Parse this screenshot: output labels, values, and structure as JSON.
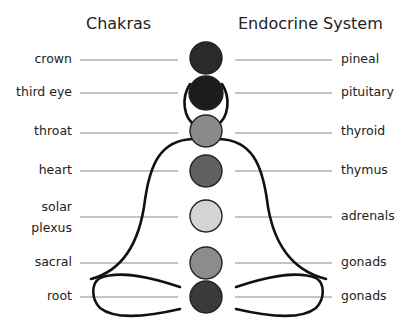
{
  "headings": {
    "chakras": "Chakras",
    "endocrine": "Endocrine System"
  },
  "rows": [
    {
      "chakra": "crown",
      "gland": "pineal",
      "color": "#2a2a2a"
    },
    {
      "chakra": "third eye",
      "gland": "pituitary",
      "color": "#1c1c1c"
    },
    {
      "chakra": "throat",
      "gland": "thyroid",
      "color": "#8a8a8a"
    },
    {
      "chakra": "heart",
      "gland": "thymus",
      "color": "#606060"
    },
    {
      "chakra": "solar plexus",
      "chakra_line1": "solar",
      "chakra_line2": "plexus",
      "gland": "adrenals",
      "color": "#d4d4d4"
    },
    {
      "chakra": "sacral",
      "gland": "gonads",
      "color": "#8c8c8c"
    },
    {
      "chakra": "root",
      "gland": "gonads",
      "color": "#3a3a3a"
    }
  ],
  "colors": {
    "connector_line": "#8a8a8a",
    "body_outline": "#111111",
    "circle_stroke": "#222222"
  }
}
